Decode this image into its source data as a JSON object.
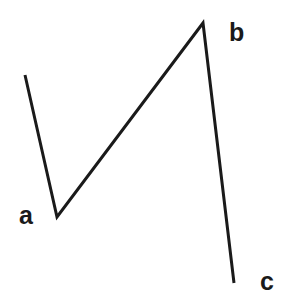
{
  "diagram": {
    "type": "polyline",
    "stroke_color": "#1a1a1a",
    "stroke_width": 3,
    "points": [
      {
        "x": 25,
        "y": 75
      },
      {
        "x": 57,
        "y": 217
      },
      {
        "x": 203,
        "y": 23
      },
      {
        "x": 234,
        "y": 283
      }
    ],
    "labels": [
      {
        "text": "a",
        "x": 19,
        "y": 224
      },
      {
        "text": "b",
        "x": 229,
        "y": 41
      },
      {
        "text": "c",
        "x": 260,
        "y": 290
      }
    ]
  }
}
